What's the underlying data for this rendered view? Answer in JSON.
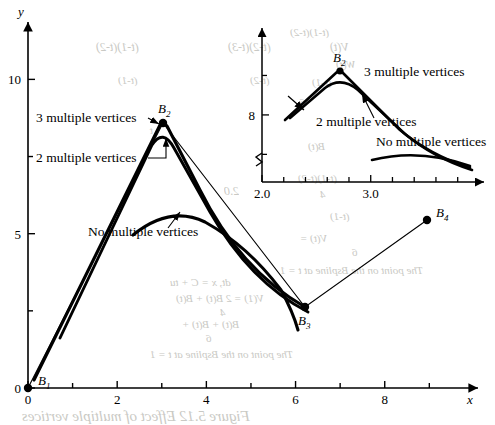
{
  "figure": {
    "main_axes": {
      "x_axis_label": "x",
      "y_axis_label": "y",
      "x_ticks": [
        {
          "value": 0,
          "label": "0",
          "major": true
        },
        {
          "value": 1,
          "label": "",
          "major": false
        },
        {
          "value": 2,
          "label": "2",
          "major": true
        },
        {
          "value": 3,
          "label": "",
          "major": false
        },
        {
          "value": 4,
          "label": "4",
          "major": true
        },
        {
          "value": 5,
          "label": "",
          "major": false
        },
        {
          "value": 6,
          "label": "6",
          "major": true
        },
        {
          "value": 7,
          "label": "",
          "major": false
        },
        {
          "value": 8,
          "label": "8",
          "major": true
        },
        {
          "value": 9,
          "label": "",
          "major": false
        }
      ],
      "y_ticks": [
        {
          "value": 0,
          "label": "0",
          "major": true
        },
        {
          "value": 2.5,
          "label": "",
          "major": false
        },
        {
          "value": 5,
          "label": "5",
          "major": true
        },
        {
          "value": 7.5,
          "label": "",
          "major": false
        },
        {
          "value": 10,
          "label": "10",
          "major": true
        }
      ],
      "xlim": [
        0,
        9.8
      ],
      "ylim": [
        0,
        11.6
      ]
    },
    "inset_axes": {
      "x_ticks": [
        {
          "value": 2.0,
          "label": "2.0",
          "major": true
        },
        {
          "value": 2.2,
          "label": "",
          "major": false
        },
        {
          "value": 2.4,
          "label": "",
          "major": false
        },
        {
          "value": 2.6,
          "label": "",
          "major": false
        },
        {
          "value": 2.8,
          "label": "",
          "major": false
        },
        {
          "value": 3.0,
          "label": "3.0",
          "major": true
        },
        {
          "value": 3.2,
          "label": "",
          "major": false
        },
        {
          "value": 3.4,
          "label": "",
          "major": false
        },
        {
          "value": 3.6,
          "label": "",
          "major": false
        },
        {
          "value": 3.8,
          "label": "",
          "major": false
        }
      ],
      "y_ticks": [
        {
          "value": 7.5,
          "label": "",
          "major": false
        },
        {
          "value": 8.0,
          "label": "8",
          "major": true
        },
        {
          "value": 8.5,
          "label": "",
          "major": false
        }
      ],
      "x_axis_break": true,
      "y_axis_break": true,
      "xlim": [
        2.0,
        3.95
      ],
      "ylim": [
        7.15,
        9.0
      ]
    },
    "control_points": [
      {
        "name": "B1",
        "label": "B",
        "subscript": "1",
        "x": 0,
        "y": 0
      },
      {
        "name": "B2",
        "label": "B",
        "subscript": "2",
        "x": 3,
        "y": 8.7
      },
      {
        "name": "B3",
        "label": "B",
        "subscript": "3",
        "x": 6,
        "y": 2.5
      },
      {
        "name": "B4",
        "label": "B",
        "subscript": "4",
        "x": 9,
        "y": 6.0
      }
    ],
    "annotations": [
      {
        "name": "three-multiple-vertices",
        "text": "3 multiple vertices"
      },
      {
        "name": "two-multiple-vertices",
        "text": "2 multiple vertices"
      },
      {
        "name": "no-multiple-vertices",
        "text": "No multiple vertices"
      }
    ],
    "inset_annotations": [
      {
        "name": "three-multiple-vertices",
        "text": "3 multiple vertices"
      },
      {
        "name": "two-multiple-vertices",
        "text": "2 multiple vertices"
      },
      {
        "name": "no-multiple-vertices",
        "text": "No multiple vertices"
      }
    ],
    "bleed_through": [
      {
        "text": "(t-1)(t-2)",
        "x": 96,
        "y": 40,
        "size": 12
      },
      {
        "text": "(t-2)(t-3)",
        "x": 228,
        "y": 40,
        "size": 12
      },
      {
        "text": "V(t)",
        "x": 330,
        "y": 40,
        "size": 12
      },
      {
        "text": "(t-1)(t-2)",
        "x": 290,
        "y": 26,
        "size": 11
      },
      {
        "text": "(t-1)",
        "x": 118,
        "y": 74,
        "size": 11
      },
      {
        "text": "(t-2)",
        "x": 250,
        "y": 74,
        "size": 11
      },
      {
        "text": "W(t)",
        "x": 336,
        "y": 58,
        "size": 11
      },
      {
        "text": "(t-1)",
        "x": 312,
        "y": 76,
        "size": 11
      },
      {
        "text": "6",
        "x": 300,
        "y": 96,
        "size": 11
      },
      {
        "text": "t",
        "x": 150,
        "y": 124,
        "size": 11
      },
      {
        "text": "B(t)",
        "x": 308,
        "y": 140,
        "size": 11
      },
      {
        "text": "(t-1)(t-2)",
        "x": 298,
        "y": 172,
        "size": 11
      },
      {
        "text": "2.0",
        "x": 224,
        "y": 184,
        "size": 12
      },
      {
        "text": "4",
        "x": 320,
        "y": 188,
        "size": 11
      },
      {
        "text": "(t-1)",
        "x": 330,
        "y": 210,
        "size": 11
      },
      {
        "text": "V(t) =",
        "x": 300,
        "y": 232,
        "size": 11
      },
      {
        "text": "6",
        "x": 352,
        "y": 246,
        "size": 11
      },
      {
        "text": "The point on the Bspline at t = 1",
        "x": 280,
        "y": 264,
        "size": 11
      },
      {
        "text": "dt, x = C + tu",
        "x": 170,
        "y": 276,
        "size": 11
      },
      {
        "text": "V(1) = 2 B(t) + B(t)",
        "x": 176,
        "y": 292,
        "size": 11
      },
      {
        "text": "4",
        "x": 220,
        "y": 306,
        "size": 11
      },
      {
        "text": "B(t) + B(t) +",
        "x": 182,
        "y": 318,
        "size": 11
      },
      {
        "text": "6",
        "x": 206,
        "y": 332,
        "size": 11
      },
      {
        "text": "The point on the Bspline at t = 1",
        "x": 150,
        "y": 348,
        "size": 11
      },
      {
        "text": "Figure 5.12   Effect of multiple vertices",
        "x": 22,
        "y": 408,
        "size": 15
      }
    ]
  }
}
